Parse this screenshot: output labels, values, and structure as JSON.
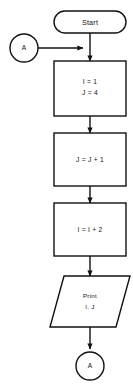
{
  "diagram": {
    "background_color": "#ffffff",
    "stroke_color": "#111111",
    "fill_color": "#ffffff"
  },
  "nodes": {
    "start": {
      "label": "Start",
      "shape": "terminator"
    },
    "connector_in": {
      "label": "A",
      "shape": "connector"
    },
    "process_1": {
      "line1": "I = 1",
      "line2": "J = 4",
      "shape": "process"
    },
    "process_2": {
      "line1": "J = J + 1",
      "shape": "process"
    },
    "process_3": {
      "line1": "I = I + 2",
      "shape": "process"
    },
    "output": {
      "line1": "Print",
      "line2": "I, J",
      "shape": "input-output"
    },
    "connector_out": {
      "label": "A",
      "shape": "connector"
    }
  },
  "edges": [
    {
      "from": "connector_in",
      "to": "main-flow",
      "direction": "right",
      "arrow": true
    },
    {
      "from": "start",
      "to": "process_1",
      "direction": "down",
      "arrow": true
    },
    {
      "from": "process_1",
      "to": "process_2",
      "direction": "down",
      "arrow": true
    },
    {
      "from": "process_2",
      "to": "process_3",
      "direction": "down",
      "arrow": true
    },
    {
      "from": "process_3",
      "to": "output",
      "direction": "down",
      "arrow": true
    },
    {
      "from": "output",
      "to": "connector_out",
      "direction": "down",
      "arrow": true
    }
  ]
}
